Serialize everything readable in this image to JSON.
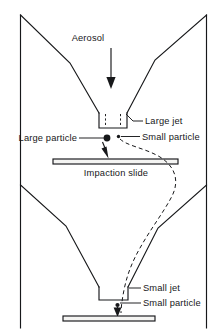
{
  "figure": {
    "background_color": "#ffffff",
    "ink_color": "#17181a",
    "slide_fill_color": "#f4f4f2",
    "width": 223,
    "height": 335
  },
  "labels": {
    "aerosol": "Aerosol",
    "large_jet": "Large jet",
    "small_particle_upper": "Small particle",
    "large_particle": "Large particle",
    "impaction_slide": "Impaction slide",
    "small_jet": "Small jet",
    "small_particle_lower": "Small particle"
  },
  "elements": {
    "aerosol_arrow": "downward-arrow",
    "stage_one": "large-jet-stage",
    "stage_two": "small-jet-stage",
    "upper_slide": "impaction-slide-upper",
    "lower_slide": "impaction-slide-lower",
    "large_particle_dot": "large-particle-marker",
    "small_particle_dot_upper": "small-particle-marker-upper",
    "small_particle_dot_lower": "small-particle-marker-lower",
    "trajectory": "small-particle-dashed-trajectory"
  }
}
